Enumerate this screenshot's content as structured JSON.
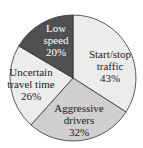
{
  "chart_data": {
    "type": "pie",
    "title": "",
    "categories": [
      "Start/stop traffic",
      "Aggressive drivers",
      "Uncertain travel time",
      "Low speed"
    ],
    "values": [
      43,
      32,
      26,
      20
    ],
    "unit": "%",
    "slice_angles_deg": [
      [
        0,
        122.6
      ],
      [
        122.6,
        221.8
      ],
      [
        221.8,
        300.6
      ],
      [
        300.6,
        360
      ]
    ],
    "colors": [
      "#ececec",
      "#cfcfcf",
      "#ececec",
      "#505050"
    ],
    "labels": [
      {
        "lines": [
          "Start/stop",
          "traffic",
          "43%"
        ]
      },
      {
        "lines": [
          "Aggressive",
          "drivers",
          "32%"
        ]
      },
      {
        "lines": [
          "Uncertain",
          "travel time",
          "26%"
        ]
      },
      {
        "lines": [
          "Low",
          "speed",
          "20%"
        ]
      }
    ],
    "legend": "none"
  }
}
